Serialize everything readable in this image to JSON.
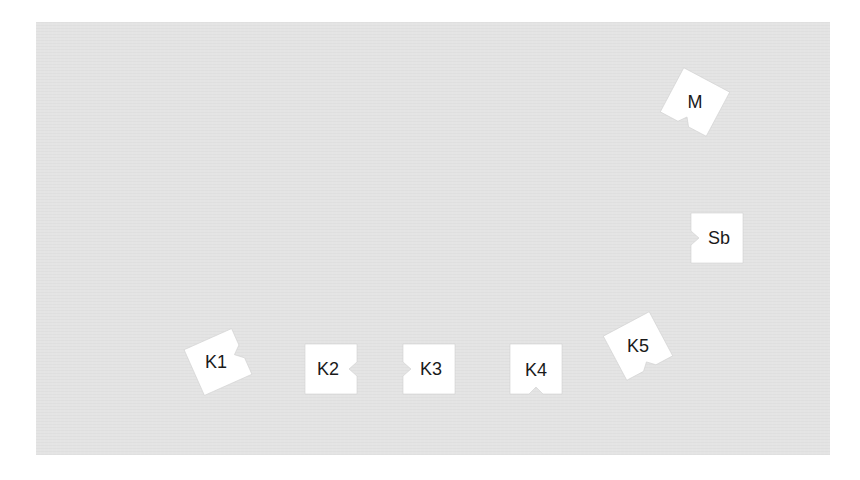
{
  "colors": {
    "background": "#ffffff",
    "panel": "#e4e4e4",
    "piece_fill": "#ffffff",
    "piece_edge": "#c8c8c8",
    "label": "#1a1a1a"
  },
  "pieces": [
    {
      "id": "M",
      "label": "M",
      "notch": "bottom",
      "rotation_deg": 28
    },
    {
      "id": "Sb",
      "label": "Sb",
      "notch": "left",
      "rotation_deg": 0
    },
    {
      "id": "K1",
      "label": "K1",
      "notch": "right",
      "rotation_deg": -24
    },
    {
      "id": "K2",
      "label": "K2",
      "notch": "right",
      "rotation_deg": 0
    },
    {
      "id": "K3",
      "label": "K3",
      "notch": "left",
      "rotation_deg": 0
    },
    {
      "id": "K4",
      "label": "K4",
      "notch": "bottom",
      "rotation_deg": 0
    },
    {
      "id": "K5",
      "label": "K5",
      "notch": "bottom",
      "rotation_deg": -28
    }
  ]
}
